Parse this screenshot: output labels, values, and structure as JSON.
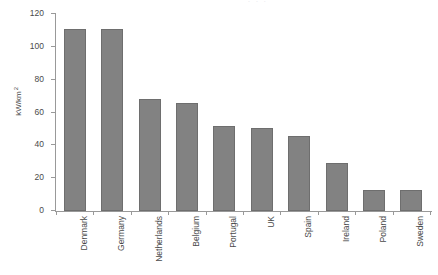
{
  "chart_data": {
    "type": "bar",
    "title": "",
    "xlabel": "",
    "ylabel": "kW/km²",
    "ylabel_base": "kW/km",
    "ylabel_exponent": "2",
    "ylim": [
      0,
      120
    ],
    "yticks": [
      0,
      20,
      40,
      60,
      80,
      100,
      120
    ],
    "grid": false,
    "legend": null,
    "categories": [
      "Denmark",
      "Germany",
      "Netherlands",
      "Belgium",
      "Portugal",
      "UK",
      "Spain",
      "Ireland",
      "Poland",
      "Sweden"
    ],
    "values": [
      111,
      111,
      68,
      65.5,
      51.5,
      50.5,
      45.5,
      29.5,
      12.5,
      12.5
    ],
    "bar_color": "#828282",
    "bar_border_color": "#6e6e6e",
    "axis_color": "#999999",
    "text_color": "#4a4a4a",
    "background": "#ffffff"
  },
  "artifacts": {
    "top_clipped_text": ". . ."
  }
}
